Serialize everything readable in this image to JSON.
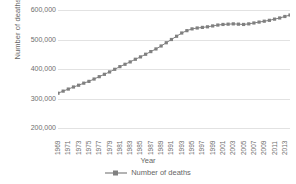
{
  "chart_data": {
    "type": "line",
    "title": "",
    "xlabel": "Year",
    "ylabel": "Number of deaths",
    "legend": [
      "Number of deaths"
    ],
    "legend_position": "bottom",
    "grid": true,
    "series_color": "#808080",
    "marker": "square",
    "ylim": [
      200000,
      600000
    ],
    "ytick_step": 100000,
    "yticks": [
      600000,
      500000,
      400000,
      300000,
      200000
    ],
    "ytick_labels": [
      "600,000",
      "500,000",
      "400,000",
      "300,000",
      "200,000"
    ],
    "xlim": [
      1969,
      2014
    ],
    "xtick_labels": [
      "1969",
      "1971",
      "1973",
      "1975",
      "1977",
      "1979",
      "1981",
      "1983",
      "1985",
      "1987",
      "1989",
      "1991",
      "1993",
      "1995",
      "1997",
      "1999",
      "2001",
      "2003",
      "2005",
      "2007",
      "2009",
      "2011",
      "2013"
    ],
    "x": [
      1969,
      1970,
      1971,
      1972,
      1973,
      1974,
      1975,
      1976,
      1977,
      1978,
      1979,
      1980,
      1981,
      1982,
      1983,
      1984,
      1985,
      1986,
      1987,
      1988,
      1989,
      1990,
      1991,
      1992,
      1993,
      1994,
      1995,
      1996,
      1997,
      1998,
      1999,
      2000,
      2001,
      2002,
      2003,
      2004,
      2005,
      2006,
      2007,
      2008,
      2009,
      2010,
      2011,
      2012,
      2013,
      2014
    ],
    "values": [
      318000,
      325000,
      332000,
      339000,
      345000,
      352000,
      358000,
      366000,
      374000,
      382000,
      390000,
      399000,
      408000,
      416000,
      424000,
      433000,
      441000,
      450000,
      459000,
      468000,
      478000,
      489000,
      500000,
      511000,
      522000,
      530000,
      536000,
      539000,
      541000,
      543000,
      546000,
      549000,
      551000,
      552000,
      553000,
      552000,
      551000,
      553000,
      556000,
      559000,
      562000,
      565000,
      569000,
      573000,
      578000,
      583000
    ],
    "series": [
      {
        "name": "Number of deaths",
        "values": [
          318000,
          325000,
          332000,
          339000,
          345000,
          352000,
          358000,
          366000,
          374000,
          382000,
          390000,
          399000,
          408000,
          416000,
          424000,
          433000,
          441000,
          450000,
          459000,
          468000,
          478000,
          489000,
          500000,
          511000,
          522000,
          530000,
          536000,
          539000,
          541000,
          543000,
          546000,
          549000,
          551000,
          552000,
          553000,
          552000,
          551000,
          553000,
          556000,
          559000,
          562000,
          565000,
          569000,
          573000,
          578000,
          583000
        ]
      }
    ]
  }
}
